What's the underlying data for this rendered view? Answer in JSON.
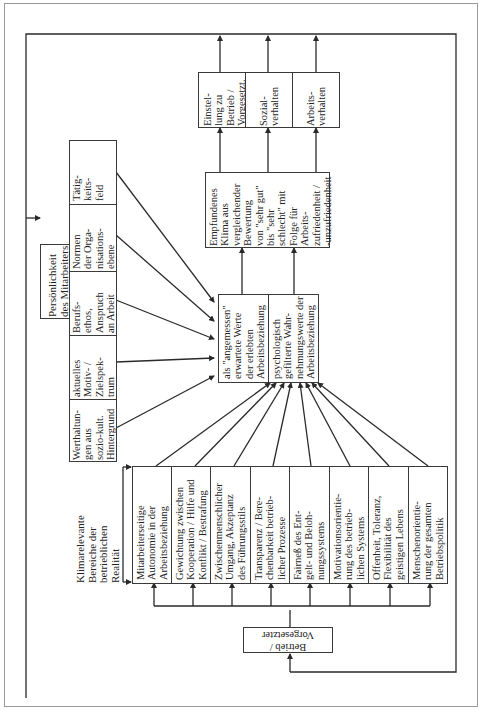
{
  "diagram": {
    "title_orientation": "rotated 90 degrees, text reads bottom-to-top",
    "outcomes": [
      {
        "id": "einstellung",
        "label": "Einstel-\nlung zu\nBetrieb /\nVorgesetzt."
      },
      {
        "id": "sozialverhalten",
        "label": "Sozial-\nverhalten"
      },
      {
        "id": "arbeitsverhalten",
        "label": "Arbeits-\nverhalten"
      }
    ],
    "climate": {
      "label": "Empfundenes\nKlima aus\nvergleichender\nBewertung\nvon \"sehr gut\"\nbis \"sehr\nschlecht\" mit\nFolge für\nArbeits-\nzufriedenheit /\n-unzufriedenheit"
    },
    "comparison": {
      "expected": "als \"angemessen\"\nerwartete Werte\nder erlebten\nArbeitsbeziehung",
      "perceived": "psychologisch\ngefilterte Wahr-\nnehmungswerte der\nArbeitsbeziehung"
    },
    "personality": {
      "title": "Persönlichkeit\ndes Mitarbeiters",
      "factors": [
        "Werthaltun-\ngen aus\nsozio-kult.\nHintergrund",
        "aktuelles\nMotiv- /\nZielspek-\ntrum",
        "Berufs-\nethos,\nAnspruch\nan Arbeit",
        "Normen\nder Orga-\nnisations-\nebene",
        "Tätig-\nkeits-\nfeld"
      ]
    },
    "reality": {
      "title": "Klimarelevante\nBereiche der\nbetrieblichen\nRealität",
      "areas": [
        "Mitarbeiterseitige\nAutonomie in der\nArbeitsbeziehung",
        "Gewichtung zwischen\nKooperation / Hilfe und\nKonflikt / Bestrafung",
        "Zwischenmenschlicher\nUmgang, Akzeptanz\ndes Führungsstils",
        "Transparenz / Bere-\nchenbarkeit betrieb-\nlicher Prozesse",
        "Fairneß des Ent-\ngelt- und Beloh-\nnungssystems",
        "Motivationsorientie-\nrung des betrieb-\nlichen Systems",
        "Offenheit, Toleranz,\nFlexibilität des\ngeistigen Lebens",
        "Menschenorientie-\nrung der gesamten\nBetriebspolitik"
      ]
    },
    "source": {
      "label": "Betrieb /\nVorgesetzter"
    },
    "colors": {
      "line": "#2a2a2a",
      "frame": "#9a9a9a",
      "background": "#ffffff"
    }
  }
}
